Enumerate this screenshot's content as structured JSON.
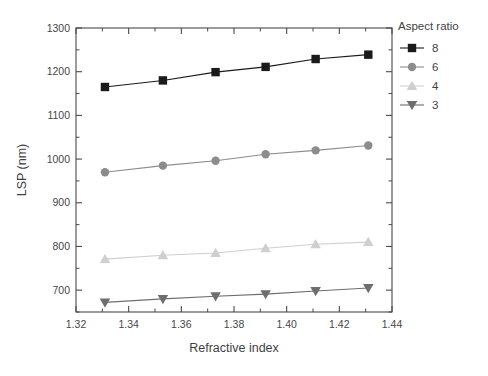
{
  "chart_data": {
    "type": "line",
    "title": "",
    "xlabel": "Refractive index",
    "ylabel": "LSP (nm)",
    "xlim": [
      1.32,
      1.44
    ],
    "ylim": [
      650,
      1300
    ],
    "xticks": [
      1.32,
      1.34,
      1.36,
      1.38,
      1.4,
      1.42,
      1.44
    ],
    "xtick_labels": [
      "1.32",
      "1.34",
      "1.36",
      "1.38",
      "1.40",
      "1.42",
      "1.44"
    ],
    "yticks": [
      700,
      800,
      900,
      1000,
      1100,
      1200,
      1300
    ],
    "ytick_labels": [
      "700",
      "800",
      "900",
      "1000",
      "1100",
      "1200",
      "1300"
    ],
    "yminor_step": 50,
    "grid": false,
    "legend_position": "outside-right-top",
    "legend_title": "Aspect ratio",
    "x": [
      1.331,
      1.353,
      1.373,
      1.392,
      1.411,
      1.431
    ],
    "series": [
      {
        "name": "8",
        "marker": "square",
        "color": "#1a1a1a",
        "values": [
          1165,
          1180,
          1199,
          1211,
          1229,
          1239
        ]
      },
      {
        "name": "6",
        "marker": "circle",
        "color": "#8c8c8c",
        "values": [
          970,
          985,
          996,
          1011,
          1020,
          1031
        ]
      },
      {
        "name": "4",
        "marker": "triangle-up",
        "color": "#cfcfcf",
        "values": [
          771,
          780,
          785,
          796,
          805,
          810
        ]
      },
      {
        "name": "3",
        "marker": "triangle-down",
        "color": "#6e6e6e",
        "values": [
          672,
          680,
          686,
          691,
          698,
          705
        ]
      }
    ]
  },
  "figure": {
    "background": "#ffffff",
    "axis_color": "#4a4a4a"
  }
}
